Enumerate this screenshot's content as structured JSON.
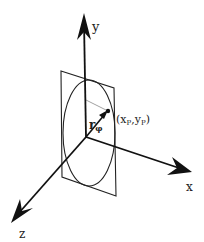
{
  "diagram": {
    "axes": {
      "x_label": "x",
      "y_label": "y",
      "z_label": "z"
    },
    "point": {
      "label_open": "(x",
      "label_x_sub": "P",
      "label_comma": ",y",
      "label_y_sub": "P",
      "label_close": ")"
    },
    "radius_vector": {
      "label": "r",
      "subscript": "φ"
    },
    "colors": {
      "line": "#111111",
      "guide": "#888888",
      "background": "#ffffff"
    }
  }
}
